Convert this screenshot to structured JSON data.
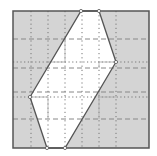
{
  "figure": {
    "colors": {
      "background": "#ffffff",
      "shade": "#d4d4d4",
      "border": "#555555",
      "polygon_edge": "#555555",
      "grid_dotted": "#777777",
      "grid_dashed": "#888888",
      "helper_solid": "#aaaaaa",
      "vertex": "#ffffff"
    },
    "square": {
      "x": 13,
      "y": 11,
      "w": 136,
      "h": 137
    },
    "hexagon": {
      "points": [
        [
          81,
          11
        ],
        [
          99,
          11
        ],
        [
          116,
          62
        ],
        [
          65,
          148
        ],
        [
          47,
          148
        ],
        [
          30,
          97
        ]
      ]
    },
    "grid": {
      "vertical_dotted_x": [
        31,
        48,
        65,
        82,
        99,
        116
      ],
      "horizontal_dotted_y": [
        62,
        97
      ],
      "horizontal_dashed_y": [
        39,
        68,
        92,
        119
      ]
    },
    "helper_lines": [
      [
        [
          65,
          39
        ],
        [
          65,
          62
        ]
      ],
      [
        [
          48,
          62
        ],
        [
          65,
          62
        ]
      ],
      [
        [
          31,
          97
        ],
        [
          48,
          97
        ]
      ],
      [
        [
          48,
          97
        ],
        [
          48,
          119
        ]
      ],
      [
        [
          99,
          62
        ],
        [
          116,
          62
        ]
      ],
      [
        [
          99,
          62
        ],
        [
          99,
          68
        ]
      ],
      [
        [
          99,
          92
        ],
        [
          99,
          119
        ]
      ],
      [
        [
          99,
          97
        ],
        [
          116,
          97
        ]
      ]
    ]
  }
}
